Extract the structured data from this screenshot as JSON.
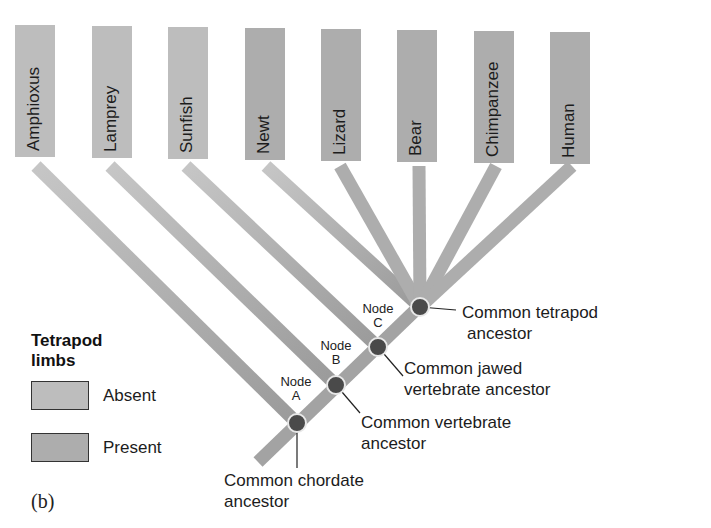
{
  "figure": {
    "panel_label": "(b)"
  },
  "colors": {
    "absent": "#bdbdbd",
    "present": "#adadad",
    "branch": "#a8a8a8",
    "node_fill": "#4a4a4a",
    "node_ring": "#e8e8e8",
    "text": "#1c1c1c"
  },
  "taxa": [
    {
      "name": "Amphioxus",
      "limbs": "absent"
    },
    {
      "name": "Lamprey",
      "limbs": "absent"
    },
    {
      "name": "Sunfish",
      "limbs": "absent"
    },
    {
      "name": "Newt",
      "limbs": "present"
    },
    {
      "name": "Lizard",
      "limbs": "present"
    },
    {
      "name": "Bear",
      "limbs": "present"
    },
    {
      "name": "Chimpanzee",
      "limbs": "present"
    },
    {
      "name": "Human",
      "limbs": "present"
    }
  ],
  "nodes": [
    {
      "id": "A",
      "label_line1": "Node",
      "label_line2": "A",
      "ancestor": "Common chordate ancestor",
      "ancestor_line1": "Common chordate",
      "ancestor_line2": "ancestor"
    },
    {
      "id": "B",
      "label_line1": "Node",
      "label_line2": "B",
      "ancestor": "Common vertebrate ancestor",
      "ancestor_line1": "Common vertebrate",
      "ancestor_line2": "ancestor"
    },
    {
      "id": "C",
      "label_line1": "Node",
      "label_line2": "C",
      "ancestor": "Common jawed vertebrate ancestor",
      "ancestor_line1": "Common jawed",
      "ancestor_line2": "vertebrate ancestor"
    },
    {
      "id": "D",
      "label_line1": "",
      "label_line2": "",
      "ancestor": "Common tetrapod ancestor",
      "ancestor_line1": "Common tetrapod",
      "ancestor_line2": "ancestor"
    }
  ],
  "legend": {
    "title_line1": "Tetrapod",
    "title_line2": "limbs",
    "items": [
      {
        "label": "Absent",
        "color": "#bdbdbd"
      },
      {
        "label": "Present",
        "color": "#adadad"
      }
    ]
  }
}
